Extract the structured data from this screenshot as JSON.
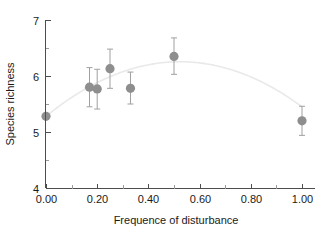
{
  "chart_data": {
    "type": "scatter",
    "title": "",
    "xlabel": "Frequence of disturbance",
    "ylabel": "Species richness",
    "xlim": [
      0.0,
      1.05
    ],
    "ylim": [
      4,
      7
    ],
    "grid": false,
    "legend": null,
    "x_ticks": [
      0.0,
      0.2,
      0.4,
      0.6,
      0.8,
      1.0
    ],
    "x_tick_labels": [
      "0.00",
      "0.20",
      "0.40",
      "0.60",
      "0.80",
      "1.00"
    ],
    "x_minor_ticks": [
      0.1,
      0.3,
      0.5,
      0.7,
      0.9
    ],
    "y_ticks": [
      4,
      5,
      6,
      7
    ],
    "y_tick_labels": [
      "4",
      "5",
      "6",
      "7"
    ],
    "y_minor_ticks": [
      4.5,
      5.5,
      6.5
    ],
    "marker_color": "#8e8e8e",
    "errorbar_color": "#a0a0a0",
    "curve_color": "#e9e9e9",
    "axis_color": "#4d4d4d",
    "points": [
      {
        "label": "p1",
        "x": 0.0,
        "y": 5.28,
        "yerr_low": 5.28,
        "yerr_high": 5.28
      },
      {
        "label": "p2",
        "x": 0.17,
        "y": 5.8,
        "yerr_low": 5.45,
        "yerr_high": 6.15
      },
      {
        "label": "p3",
        "x": 0.2,
        "y": 5.77,
        "yerr_low": 5.41,
        "yerr_high": 6.12
      },
      {
        "label": "p4",
        "x": 0.25,
        "y": 6.13,
        "yerr_low": 5.78,
        "yerr_high": 6.48
      },
      {
        "label": "p5",
        "x": 0.33,
        "y": 5.78,
        "yerr_low": 5.5,
        "yerr_high": 6.07
      },
      {
        "label": "p6",
        "x": 0.5,
        "y": 6.35,
        "yerr_low": 6.03,
        "yerr_high": 6.68
      },
      {
        "label": "p7",
        "x": 1.0,
        "y": 5.2,
        "yerr_low": 4.94,
        "yerr_high": 5.46
      }
    ],
    "fit": {
      "kind": "quadratic",
      "description": "smooth quadratic fit peaking near x = 0.52",
      "coefficients": {
        "a": -3.55,
        "b": 3.72,
        "c": 5.28
      },
      "x_start": 0.0,
      "x_end": 1.0
    }
  }
}
